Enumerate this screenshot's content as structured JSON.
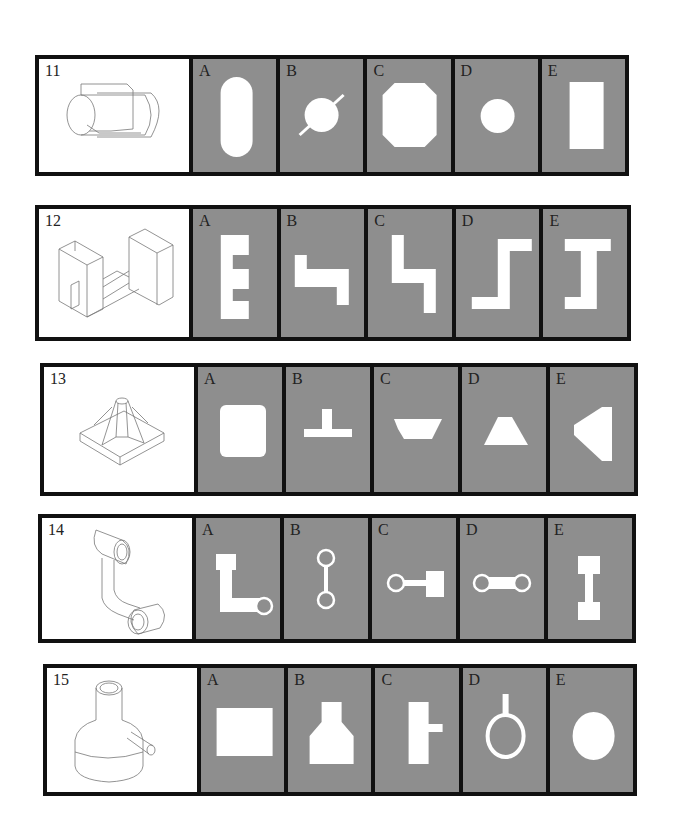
{
  "page": {
    "colors": {
      "frame": "#111111",
      "option_bg": "#8e8e8e",
      "question_bg": "#ffffff",
      "shape_fill": "#ffffff",
      "drawing_stroke": "#777777"
    }
  },
  "questions": [
    {
      "number": "11",
      "drawing": "cylinder-with-flat-flange-icon",
      "options": [
        {
          "letter": "A",
          "shape": "rounded-slot-vertical"
        },
        {
          "letter": "B",
          "shape": "circle-with-diagonal-line"
        },
        {
          "letter": "C",
          "shape": "octagon"
        },
        {
          "letter": "D",
          "shape": "small-circle"
        },
        {
          "letter": "E",
          "shape": "vertical-rectangle"
        }
      ]
    },
    {
      "number": "12",
      "drawing": "h-shaped-block-isometric-icon",
      "options": [
        {
          "letter": "A",
          "shape": "e-shape"
        },
        {
          "letter": "B",
          "shape": "z-step-horizontal"
        },
        {
          "letter": "C",
          "shape": "z-step-vertical"
        },
        {
          "letter": "D",
          "shape": "s-step-vertical"
        },
        {
          "letter": "E",
          "shape": "i-beam-shape"
        }
      ]
    },
    {
      "number": "13",
      "drawing": "pyramid-base-with-post-icon",
      "options": [
        {
          "letter": "A",
          "shape": "rounded-square"
        },
        {
          "letter": "B",
          "shape": "inverted-t"
        },
        {
          "letter": "C",
          "shape": "inverted-trapezoid"
        },
        {
          "letter": "D",
          "shape": "trapezoid"
        },
        {
          "letter": "E",
          "shape": "left-pointing-trapezoid"
        }
      ]
    },
    {
      "number": "14",
      "drawing": "bent-link-with-two-bushings-icon",
      "options": [
        {
          "letter": "A",
          "shape": "l-link-with-ring"
        },
        {
          "letter": "B",
          "shape": "vertical-dumbbell-rings"
        },
        {
          "letter": "C",
          "shape": "ring-bar-square"
        },
        {
          "letter": "D",
          "shape": "horizontal-dumbbell-rings"
        },
        {
          "letter": "E",
          "shape": "vertical-dumbbell-squares"
        }
      ]
    },
    {
      "number": "15",
      "drawing": "bottle-with-side-pipe-icon",
      "options": [
        {
          "letter": "A",
          "shape": "wide-rectangle"
        },
        {
          "letter": "B",
          "shape": "bottle-silhouette"
        },
        {
          "letter": "C",
          "shape": "rectangle-with-side-tab"
        },
        {
          "letter": "D",
          "shape": "ring-with-stem"
        },
        {
          "letter": "E",
          "shape": "ellipse"
        }
      ]
    }
  ]
}
